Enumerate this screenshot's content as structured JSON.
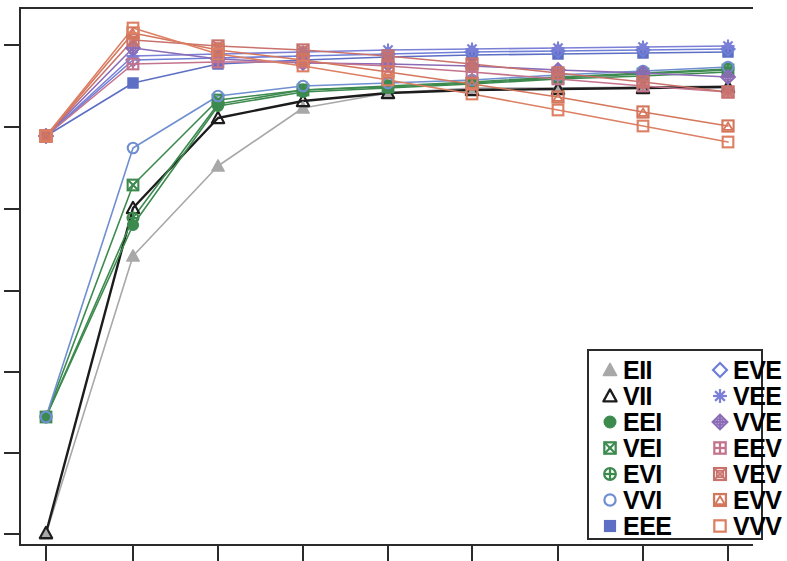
{
  "chart_data": {
    "type": "line",
    "title": "",
    "subtitle": "",
    "xlabel": "",
    "ylabel": "",
    "grid": false,
    "legend_position": "bottom-right",
    "x": [
      1,
      2,
      3,
      4,
      5,
      6,
      7,
      8,
      9
    ],
    "xtick_labels": [
      "1",
      "2",
      "3",
      "4",
      "5",
      "6",
      "7",
      "8",
      "9"
    ],
    "ytick_labels": [
      "",
      "",
      "",
      "",
      "",
      "",
      ""
    ],
    "xlim": [
      0.6,
      9.4
    ],
    "ylim": [
      0,
      100
    ],
    "axis_pixels": {
      "left": 20,
      "right": 753,
      "top": 8,
      "bottom": 545,
      "x_ticks_px": [
        46,
        133,
        218,
        303,
        388,
        472,
        558,
        643,
        728
      ],
      "y_ticks_px": [
        45,
        127,
        209,
        291,
        372,
        453,
        534
      ]
    },
    "series": [
      {
        "name": "EII",
        "symbol": "triangle-up-filled",
        "color": "#a8a8a8",
        "values_px_y": [
          534,
          256,
          166,
          108,
          93,
          88,
          88,
          87,
          86
        ],
        "values": [
          2.0,
          54.0,
          70.8,
          81.6,
          84.4,
          85.4,
          85.4,
          85.6,
          85.8
        ]
      },
      {
        "name": "VII",
        "symbol": "triangle-up-open",
        "color": "#1c1c1c",
        "values_px_y": [
          533,
          208,
          118,
          101,
          93,
          90,
          89,
          88,
          87
        ],
        "values": [
          2.2,
          62.8,
          79.6,
          82.8,
          84.4,
          85.0,
          85.2,
          85.4,
          85.6
        ]
      },
      {
        "name": "EEI",
        "symbol": "circle-filled",
        "color": "#3d8a4f",
        "values_px_y": [
          417,
          225,
          106,
          92,
          88,
          84,
          79,
          76,
          72
        ],
        "values": [
          23.8,
          59.6,
          82.0,
          84.6,
          85.4,
          86.2,
          87.1,
          87.7,
          88.4
        ]
      },
      {
        "name": "VEI",
        "symbol": "square-crossed",
        "color": "#3d8a4f",
        "values_px_y": [
          417,
          185,
          100,
          90,
          87,
          83,
          78,
          74,
          70
        ],
        "values": [
          23.8,
          67.1,
          83.2,
          85.0,
          85.6,
          86.3,
          87.3,
          88.0,
          88.8
        ]
      },
      {
        "name": "EVI",
        "symbol": "circle-crossed",
        "color": "#3d8a4f",
        "values_px_y": [
          417,
          218,
          104,
          90,
          86,
          82,
          77,
          73,
          69
        ],
        "values": [
          23.8,
          60.9,
          82.4,
          85.0,
          85.8,
          86.5,
          87.5,
          88.2,
          88.9
        ]
      },
      {
        "name": "VVI",
        "symbol": "circle-open",
        "color": "#6f8fd0",
        "values_px_y": [
          417,
          148,
          96,
          86,
          83,
          80,
          75,
          71,
          67
        ],
        "values": [
          23.8,
          74.0,
          83.9,
          85.8,
          86.4,
          87.0,
          87.9,
          88.6,
          89.3
        ]
      },
      {
        "name": "EEE",
        "symbol": "square-filled",
        "color": "#5d6fc4",
        "values_px_y": [
          136,
          83,
          64,
          60,
          57,
          55,
          54,
          53,
          52
        ],
        "values": [
          76.5,
          86.5,
          90.1,
          90.8,
          91.4,
          91.8,
          92.0,
          92.2,
          92.4
        ]
      },
      {
        "name": "EVE",
        "symbol": "diamond-open",
        "color": "#6f7fd8",
        "values_px_y": [
          136,
          60,
          58,
          56,
          54,
          52,
          51,
          50,
          49
        ],
        "values": [
          76.5,
          90.8,
          91.2,
          91.6,
          92.0,
          92.4,
          92.6,
          92.8,
          93.0
        ]
      },
      {
        "name": "VEE",
        "symbol": "asterisk",
        "color": "#7b7fd6",
        "values_px_y": [
          136,
          56,
          54,
          52,
          50,
          49,
          48,
          47,
          46
        ],
        "values": [
          76.5,
          91.6,
          92.0,
          92.4,
          92.8,
          93.0,
          93.2,
          93.4,
          93.6
        ]
      },
      {
        "name": "VVE",
        "symbol": "diamond-plus",
        "color": "#8b6bb5",
        "values_px_y": [
          136,
          48,
          59,
          63,
          64,
          66,
          70,
          73,
          77
        ],
        "values": [
          77.0,
          93.2,
          91.0,
          90.3,
          90.1,
          89.7,
          89.0,
          88.4,
          87.7
        ]
      },
      {
        "name": "EEV",
        "symbol": "square-plus",
        "color": "#c4738c",
        "values_px_y": [
          136,
          64,
          62,
          62,
          66,
          72,
          79,
          86,
          92
        ],
        "values": [
          77.0,
          90.1,
          90.4,
          90.4,
          89.7,
          88.6,
          87.3,
          86.0,
          84.8
        ]
      },
      {
        "name": "VEV",
        "symbol": "square-crossed-box",
        "color": "#c9726c",
        "values_px_y": [
          136,
          40,
          46,
          50,
          56,
          64,
          73,
          82,
          92
        ],
        "values": [
          77.2,
          94.7,
          93.6,
          92.8,
          91.8,
          90.1,
          88.4,
          86.8,
          84.8
        ]
      },
      {
        "name": "EVV",
        "symbol": "square-triangle",
        "color": "#d4765c",
        "values_px_y": [
          136,
          33,
          50,
          60,
          72,
          84,
          97,
          112,
          126
        ],
        "values": [
          77.4,
          96.0,
          92.8,
          91.0,
          88.7,
          86.5,
          84.0,
          81.3,
          78.6
        ]
      },
      {
        "name": "VVV",
        "symbol": "square-open",
        "color": "#dd7f63",
        "values_px_y": [
          136,
          28,
          54,
          66,
          80,
          94,
          110,
          126,
          142
        ],
        "values": [
          77.6,
          96.9,
          92.1,
          89.8,
          87.2,
          84.6,
          81.6,
          78.6,
          75.7
        ]
      }
    ]
  },
  "legend": {
    "columns": [
      [
        {
          "label": "EII",
          "symbol": "triangle-up-filled",
          "color": "#a8a8a8"
        },
        {
          "label": "VII",
          "symbol": "triangle-up-open",
          "color": "#1c1c1c"
        },
        {
          "label": "EEI",
          "symbol": "circle-filled",
          "color": "#3d8a4f"
        },
        {
          "label": "VEI",
          "symbol": "square-crossed",
          "color": "#3d8a4f"
        },
        {
          "label": "EVI",
          "symbol": "circle-crossed",
          "color": "#3d8a4f"
        },
        {
          "label": "VVI",
          "symbol": "circle-open",
          "color": "#6f8fd0"
        },
        {
          "label": "EEE",
          "symbol": "square-filled",
          "color": "#5d6fc4"
        }
      ],
      [
        {
          "label": "EVE",
          "symbol": "diamond-open",
          "color": "#6f7fd8"
        },
        {
          "label": "VEE",
          "symbol": "asterisk",
          "color": "#7b7fd6"
        },
        {
          "label": "VVE",
          "symbol": "diamond-plus",
          "color": "#8b6bb5"
        },
        {
          "label": "EEV",
          "symbol": "square-plus",
          "color": "#c4738c"
        },
        {
          "label": "VEV",
          "symbol": "square-crossed-box",
          "color": "#c9726c"
        },
        {
          "label": "EVV",
          "symbol": "square-triangle",
          "color": "#d4765c"
        },
        {
          "label": "VVV",
          "symbol": "square-open",
          "color": "#dd7f63"
        }
      ]
    ],
    "box_px": {
      "left": 587,
      "top": 349,
      "width": 176,
      "height": 191
    }
  },
  "frame": {
    "color": "#2b2b2b"
  }
}
